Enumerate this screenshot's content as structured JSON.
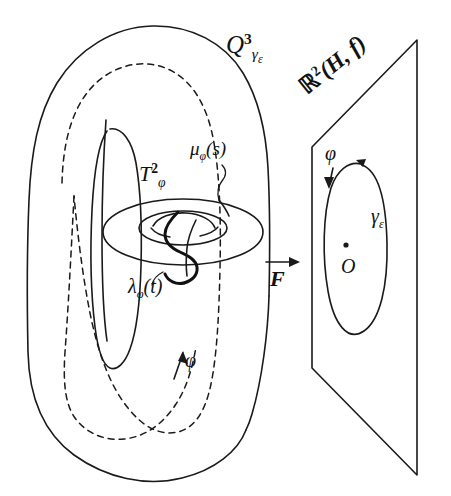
{
  "figure": {
    "kind": "mathematical-diagram",
    "background_color": "#ffffff",
    "ink_color": "#1a1a1a",
    "width": 451,
    "height": 496
  },
  "labels": {
    "solid_torus": {
      "base": "Q",
      "superscript": "3",
      "subscript": "γ",
      "subscript_sub": "ε",
      "full": "Q³_{γε}"
    },
    "plane": {
      "base": "ℝ",
      "superscript": "2",
      "args": "(H, f)",
      "full": "ℝ²(H, f)"
    },
    "meridian_curve": {
      "base": "μ",
      "subscript": "φ",
      "args": "(s)",
      "full": "μ_φ(s)"
    },
    "invariant_torus": {
      "base": "T",
      "superscript": "2",
      "subscript": "φ",
      "full": "T²_φ"
    },
    "longitude_curve": {
      "base": "λ",
      "subscript": "φ",
      "args": "(t)",
      "full": "λ_φ(t)"
    },
    "map_arrow": {
      "base": "F",
      "full": "F",
      "has_overarrow": true
    },
    "phi_torus": {
      "base": "φ",
      "full": "φ"
    },
    "phi_plane": {
      "base": "φ",
      "full": "φ"
    },
    "gamma_epsilon": {
      "base": "γ",
      "subscript": "ε",
      "full": "γ_ε"
    },
    "origin": {
      "base": "O",
      "full": "O"
    }
  },
  "elements": {
    "outer_torus_name": "solid-torus-outline",
    "inner_hole_name": "torus-inner-hole",
    "hidden_core_name": "torus-hidden-core-dashed",
    "small_torus_name": "invariant-torus",
    "plane_name": "target-plane",
    "ellipse_name": "gamma-epsilon-ellipse",
    "origin_dot_name": "origin-dot"
  }
}
